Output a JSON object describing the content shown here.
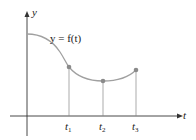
{
  "diagram": {
    "y_axis_label": "y",
    "t_axis_label": "t",
    "function_label": "y = f(t)",
    "curve_color": "#a0a0a0",
    "point_color": "#8a8a8a",
    "axis_color": "#333333",
    "points": [
      {
        "label": "t",
        "subscript": "1"
      },
      {
        "label": "t",
        "subscript": "2"
      },
      {
        "label": "t",
        "subscript": "3"
      }
    ]
  }
}
